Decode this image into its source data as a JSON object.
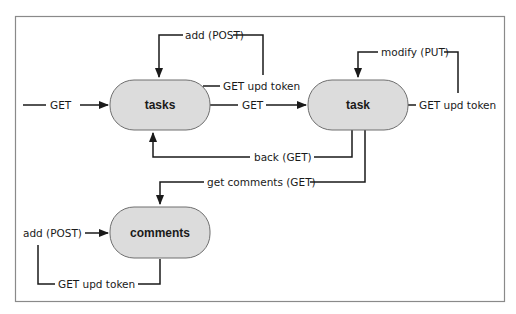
{
  "diagram": {
    "type": "state-transition",
    "colors": {
      "node_fill": "#dcdcdc",
      "node_stroke": "#6f6f6f",
      "edge": "#1a1a1a",
      "frame": "#8a8a8a",
      "background": "#ffffff"
    },
    "nodes": [
      {
        "id": "tasks",
        "label": "tasks"
      },
      {
        "id": "task",
        "label": "task"
      },
      {
        "id": "comments",
        "label": "comments"
      }
    ],
    "edges": [
      {
        "id": "entry-get",
        "from": "",
        "to": "tasks",
        "label": "GET"
      },
      {
        "id": "tasks-add-post",
        "from": "tasks",
        "to": "tasks",
        "label": "add (POST)"
      },
      {
        "id": "tasks-get-upd-token",
        "from": "tasks",
        "to": "tasks",
        "label": "GET upd token"
      },
      {
        "id": "tasks-to-task-get",
        "from": "tasks",
        "to": "task",
        "label": "GET"
      },
      {
        "id": "task-modify-put",
        "from": "task",
        "to": "task",
        "label": "modify (PUT)"
      },
      {
        "id": "task-get-upd-token",
        "from": "task",
        "to": "task",
        "label": "GET upd token"
      },
      {
        "id": "task-back-get",
        "from": "task",
        "to": "tasks",
        "label": "back (GET)"
      },
      {
        "id": "task-get-comments",
        "from": "task",
        "to": "comments",
        "label": "get comments (GET)"
      },
      {
        "id": "comments-add-post",
        "from": "comments",
        "to": "comments",
        "label": "add (POST)"
      },
      {
        "id": "comments-get-upd-token",
        "from": "comments",
        "to": "comments",
        "label": "GET upd token"
      }
    ]
  }
}
